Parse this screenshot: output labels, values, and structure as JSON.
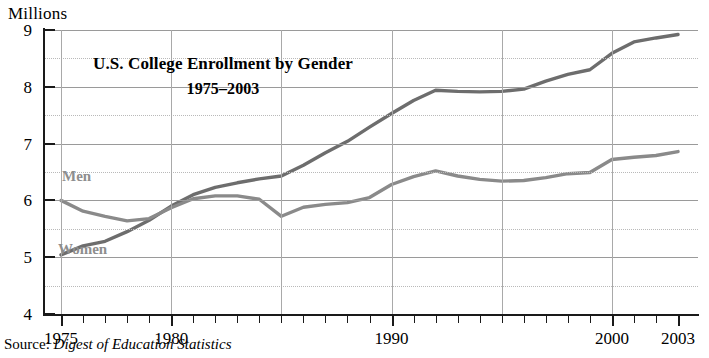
{
  "axis_unit_label": "Millions",
  "title": {
    "line1": "U.S. College Enrollment by Gender",
    "line2": "1975–2003"
  },
  "series_labels": {
    "men": "Men",
    "women": "Women"
  },
  "source": {
    "prefix": "Source:",
    "title": "Digest of Education Statistics"
  },
  "chart_data": {
    "type": "line",
    "title": "U.S. College Enrollment by Gender 1975–2003",
    "subtitle": "1975–2003",
    "xlabel": "",
    "ylabel": "Millions",
    "xlim": [
      1975,
      2003
    ],
    "ylim": [
      4,
      9
    ],
    "y_major_ticks": [
      4,
      5,
      6,
      7,
      8,
      9
    ],
    "y_minor_ticks": [
      4.5,
      5.5,
      6.5,
      7.5,
      8.5
    ],
    "x_tick_labels": [
      "1975",
      "1980",
      "1990",
      "2000",
      "2003"
    ],
    "x_tick_label_values": [
      1975,
      1980,
      1990,
      2000,
      2003
    ],
    "x_minor_tick_interval": 1,
    "grid": true,
    "grid_major_color": "#9a9a9a",
    "grid_minor_color": "#bbbbbb",
    "legend": "inline-labels",
    "x": [
      1975,
      1976,
      1977,
      1978,
      1979,
      1980,
      1981,
      1982,
      1983,
      1984,
      1985,
      1986,
      1987,
      1988,
      1989,
      1990,
      1991,
      1992,
      1993,
      1994,
      1995,
      1996,
      1997,
      1998,
      1999,
      2000,
      2001,
      2002,
      2003
    ],
    "series": [
      {
        "name": "Women",
        "color": "#6d6d6d",
        "values": [
          5.04,
          5.2,
          5.28,
          5.45,
          5.65,
          5.9,
          6.1,
          6.23,
          6.31,
          6.38,
          6.43,
          6.62,
          6.84,
          7.04,
          7.29,
          7.53,
          7.76,
          7.94,
          7.92,
          7.91,
          7.92,
          7.96,
          8.1,
          8.22,
          8.3,
          8.59,
          8.79,
          8.86,
          8.92
        ]
      },
      {
        "name": "Men",
        "color": "#8a8a8a",
        "values": [
          6.0,
          5.81,
          5.72,
          5.64,
          5.68,
          5.87,
          6.03,
          6.08,
          6.08,
          6.02,
          5.72,
          5.88,
          5.93,
          5.96,
          6.05,
          6.28,
          6.42,
          6.52,
          6.43,
          6.37,
          6.34,
          6.35,
          6.4,
          6.47,
          6.49,
          6.72,
          6.76,
          6.79,
          6.86
        ]
      }
    ]
  }
}
